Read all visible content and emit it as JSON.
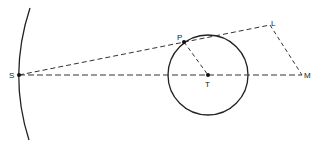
{
  "diagram": {
    "colors": {
      "stroke": "#222222",
      "dash": "#333333",
      "background": "#ffffff"
    },
    "points": {
      "S": {
        "label": "S",
        "x": 19,
        "y": 75
      },
      "P": {
        "label": "P",
        "x": 184,
        "y": 42
      },
      "T": {
        "label": "T",
        "x": 208,
        "y": 75
      },
      "L": {
        "label": "L",
        "x": 270,
        "y": 25
      },
      "M": {
        "label": "M",
        "x": 302,
        "y": 75
      }
    },
    "circle": {
      "center": "T",
      "radius": 40
    },
    "arc": {
      "description": "curved boundary through S"
    },
    "dashed_lines": [
      [
        "S",
        "L"
      ],
      [
        "S",
        "M"
      ],
      [
        "P",
        "T"
      ],
      [
        "L",
        "M"
      ]
    ]
  }
}
